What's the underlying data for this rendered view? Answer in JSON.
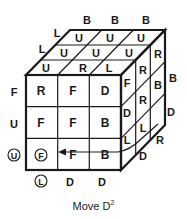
{
  "figure": {
    "caption": "Move D",
    "caption_superscript": "2",
    "ink_color": "#1a1a1a",
    "background": "#ffffff"
  },
  "cube": {
    "top_face": [
      [
        "U",
        "U",
        "U"
      ],
      [
        "U",
        "U",
        "U"
      ],
      [
        "U",
        "R",
        "L"
      ]
    ],
    "front_face": [
      [
        "R",
        "F",
        "D"
      ],
      [
        "F",
        "F",
        "B"
      ],
      [
        "F",
        "F",
        "B"
      ]
    ],
    "right_face": [
      [
        "F",
        "R",
        "R"
      ],
      [
        "D",
        "R",
        "B"
      ],
      [
        "L",
        "L",
        ""
      ]
    ],
    "front_face_circled_cell": "F"
  },
  "outer_labels": {
    "top_back": [
      "B",
      "B",
      "B"
    ],
    "top_left": [
      "L",
      "L"
    ],
    "front_left": [
      "F",
      "U",
      "U"
    ],
    "front_left_circled": "U",
    "front_bottom": [
      "L",
      "D",
      "D"
    ],
    "front_bottom_circled": "L",
    "right_back": [
      "B",
      "D",
      "R"
    ],
    "right_bottom": [
      "D"
    ]
  }
}
